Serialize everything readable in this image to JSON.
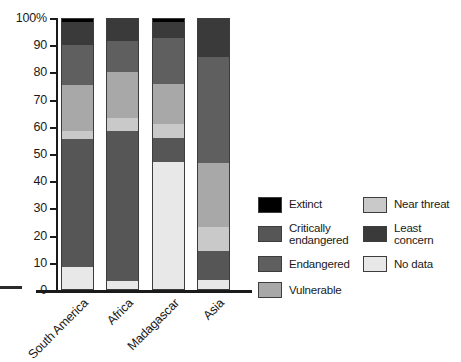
{
  "chart_data": {
    "type": "bar",
    "stacked": true,
    "title": "",
    "xlabel": "",
    "ylabel": "",
    "ylim": [
      0,
      100
    ],
    "yticks": [
      0,
      10,
      20,
      30,
      40,
      50,
      60,
      70,
      80,
      90,
      100
    ],
    "ytick_labels": [
      "0",
      "10",
      "20",
      "30",
      "40",
      "50",
      "60",
      "70",
      "80",
      "90",
      "100%"
    ],
    "grid": false,
    "legend_position": "right",
    "categories": [
      "South America",
      "Africa",
      "Madagascar",
      "Asia"
    ],
    "series": [
      {
        "name": "Extinct",
        "color": "#000000",
        "values": [
          1.0,
          0.0,
          1.0,
          0.0
        ]
      },
      {
        "name": "Critically endangered",
        "color": "#565656",
        "values": [
          47.5,
          55.5,
          9.0,
          10.5
        ]
      },
      {
        "name": "Endangered",
        "color": "#5f5f5f",
        "values": [
          15.0,
          11.5,
          17.0,
          39.5
        ]
      },
      {
        "name": "Vulnerable",
        "color": "#a8a8a8",
        "values": [
          17.0,
          17.0,
          15.0,
          23.5
        ]
      },
      {
        "name": "Near threat",
        "color": "#c9c9c9",
        "values": [
          3.0,
          5.0,
          5.0,
          9.0
        ]
      },
      {
        "name": "Least concern",
        "color": "#3a3a3a",
        "values": [
          8.5,
          8.0,
          6.0,
          14.0
        ]
      },
      {
        "name": "No data",
        "color": "#e8e8e8",
        "values": [
          8.0,
          3.0,
          47.0,
          3.5
        ]
      }
    ],
    "stack_order_top_to_bottom": [
      "Extinct",
      "Least concern",
      "Endangered",
      "Vulnerable",
      "Near threat",
      "Critically endangered",
      "No data"
    ],
    "bars": [
      {
        "category": "South America",
        "segments_bottom_to_top": [
          {
            "name": "No data",
            "from": 0,
            "to": 8.0,
            "color": "#e8e8e8"
          },
          {
            "name": "Critically endangered",
            "from": 8.0,
            "to": 55.5,
            "color": "#565656"
          },
          {
            "name": "Near threat",
            "from": 55.5,
            "to": 58.5,
            "color": "#c9c9c9"
          },
          {
            "name": "Vulnerable",
            "from": 58.5,
            "to": 75.5,
            "color": "#a8a8a8"
          },
          {
            "name": "Endangered",
            "from": 75.5,
            "to": 90.5,
            "color": "#5f5f5f"
          },
          {
            "name": "Least concern",
            "from": 90.5,
            "to": 99.0,
            "color": "#3a3a3a"
          },
          {
            "name": "Extinct",
            "from": 99.0,
            "to": 100.0,
            "color": "#000000"
          }
        ]
      },
      {
        "category": "Africa",
        "segments_bottom_to_top": [
          {
            "name": "No data",
            "from": 0,
            "to": 3.0,
            "color": "#e8e8e8"
          },
          {
            "name": "Critically endangered",
            "from": 3.0,
            "to": 58.5,
            "color": "#565656"
          },
          {
            "name": "Near threat",
            "from": 58.5,
            "to": 63.5,
            "color": "#c9c9c9"
          },
          {
            "name": "Vulnerable",
            "from": 63.5,
            "to": 80.5,
            "color": "#a8a8a8"
          },
          {
            "name": "Endangered",
            "from": 80.5,
            "to": 92.0,
            "color": "#5f5f5f"
          },
          {
            "name": "Least concern",
            "from": 92.0,
            "to": 100.0,
            "color": "#3a3a3a"
          }
        ]
      },
      {
        "category": "Madagascar",
        "segments_bottom_to_top": [
          {
            "name": "No data",
            "from": 0,
            "to": 47.0,
            "color": "#e8e8e8"
          },
          {
            "name": "Critically endangered",
            "from": 47.0,
            "to": 56.0,
            "color": "#565656"
          },
          {
            "name": "Near threat",
            "from": 56.0,
            "to": 61.0,
            "color": "#c9c9c9"
          },
          {
            "name": "Vulnerable",
            "from": 61.0,
            "to": 76.0,
            "color": "#a8a8a8"
          },
          {
            "name": "Endangered",
            "from": 76.0,
            "to": 93.0,
            "color": "#5f5f5f"
          },
          {
            "name": "Least concern",
            "from": 93.0,
            "to": 99.0,
            "color": "#3a3a3a"
          },
          {
            "name": "Extinct",
            "from": 99.0,
            "to": 100.0,
            "color": "#000000"
          }
        ]
      },
      {
        "category": "Asia",
        "segments_bottom_to_top": [
          {
            "name": "No data",
            "from": 0,
            "to": 3.5,
            "color": "#e8e8e8"
          },
          {
            "name": "Critically endangered",
            "from": 3.5,
            "to": 14.0,
            "color": "#565656"
          },
          {
            "name": "Near threat",
            "from": 14.0,
            "to": 23.0,
            "color": "#c9c9c9"
          },
          {
            "name": "Vulnerable",
            "from": 23.0,
            "to": 46.5,
            "color": "#a8a8a8"
          },
          {
            "name": "Endangered",
            "from": 46.5,
            "to": 86.0,
            "color": "#5f5f5f"
          },
          {
            "name": "Least concern",
            "from": 86.0,
            "to": 100.0,
            "color": "#3a3a3a"
          }
        ]
      }
    ],
    "legend": {
      "column_left": [
        {
          "label": "Extinct",
          "color": "#000000"
        },
        {
          "label": "Critically\nendangered",
          "color": "#565656"
        },
        {
          "label": "Endangered",
          "color": "#5f5f5f"
        },
        {
          "label": "Vulnerable",
          "color": "#a8a8a8"
        }
      ],
      "column_right": [
        {
          "label": "Near threat",
          "color": "#c9c9c9"
        },
        {
          "label": "Least concern",
          "color": "#3a3a3a"
        },
        {
          "label": "No data",
          "color": "#e8e8e8"
        }
      ]
    }
  }
}
